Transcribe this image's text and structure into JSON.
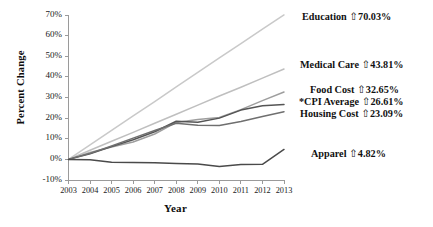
{
  "chart_data": {
    "type": "line",
    "title": "",
    "xlabel": "Year",
    "ylabel": "Percent Change",
    "x": [
      2003,
      2004,
      2005,
      2006,
      2007,
      2008,
      2009,
      2010,
      2011,
      2012,
      2013
    ],
    "categories": [
      "2003",
      "2004",
      "2005",
      "2006",
      "2007",
      "2008",
      "2009",
      "2010",
      "2011",
      "2012",
      "2013"
    ],
    "xlim": [
      2003,
      2013
    ],
    "ylim": [
      -10,
      70
    ],
    "ytick_labels": [
      "70%",
      "60%",
      "50%",
      "40%",
      "30%",
      "20%",
      "10%",
      "0%",
      "-10%"
    ],
    "ytick_values": [
      70,
      60,
      50,
      40,
      30,
      20,
      10,
      0,
      -10
    ],
    "grid": false,
    "legend_position": "right-inline-labels",
    "footnote_marker": "*",
    "series": [
      {
        "name": "Education",
        "label": "Education",
        "arrow": "⇧",
        "end_value_text": "70.03%",
        "end_value": 70.03,
        "color": "#c9c9c9",
        "values": [
          0,
          7.0,
          14.1,
          21.1,
          28.0,
          35.2,
          42.2,
          49.2,
          56.1,
          63.1,
          70.03
        ]
      },
      {
        "name": "Medical Care",
        "label": "Medical Care",
        "arrow": "⇧",
        "end_value_text": "43.81%",
        "end_value": 43.81,
        "color": "#bfbfbf",
        "values": [
          0,
          4.4,
          8.8,
          13.1,
          17.5,
          21.9,
          26.3,
          30.7,
          35.0,
          39.4,
          43.81
        ]
      },
      {
        "name": "Food Cost",
        "label": "Food Cost",
        "arrow": "⇧",
        "end_value_text": "32.65%",
        "end_value": 32.65,
        "color": "#9e9e9e",
        "values": [
          0,
          3.4,
          6.0,
          8.4,
          12.3,
          17.9,
          19.3,
          20.3,
          24.1,
          28.5,
          32.65
        ]
      },
      {
        "name": "*CPI Average",
        "label": "*CPI Average",
        "arrow": "⇧",
        "end_value_text": "26.61%",
        "end_value": 26.61,
        "color": "#555555",
        "values": [
          0,
          2.7,
          6.2,
          9.5,
          13.4,
          18.5,
          18.0,
          20.0,
          23.9,
          26.0,
          26.61
        ]
      },
      {
        "name": "Housing Cost",
        "label": "Housing Cost",
        "arrow": "⇧",
        "end_value_text": "23.09%",
        "end_value": 23.09,
        "color": "#6f6f6f",
        "values": [
          0,
          2.9,
          6.5,
          10.3,
          14.0,
          17.5,
          16.6,
          16.4,
          18.4,
          20.8,
          23.09
        ]
      },
      {
        "name": "Apparel",
        "label": "Apparel",
        "arrow": "⇧",
        "end_value_text": "4.82%",
        "end_value": 4.82,
        "color": "#4a4a4a",
        "values": [
          0,
          -0.2,
          -1.4,
          -1.5,
          -1.6,
          -2.0,
          -2.2,
          -3.4,
          -2.5,
          -2.4,
          4.82
        ]
      }
    ],
    "labels": [
      {
        "text": "Education",
        "arrow": "⇧",
        "value": "70.03%",
        "left": 302,
        "top": 11
      },
      {
        "text": "Medical Care",
        "arrow": "⇧",
        "value": "43.81%",
        "left": 300,
        "top": 59
      },
      {
        "text": "Food Cost",
        "arrow": "⇧",
        "value": "32.65%",
        "left": 310,
        "top": 84
      },
      {
        "text": "*CPI Average",
        "arrow": "⇧",
        "value": "26.61%",
        "left": 299,
        "top": 96
      },
      {
        "text": "Housing Cost",
        "arrow": "⇧",
        "value": "23.09%",
        "left": 300,
        "top": 108
      },
      {
        "text": "Apparel",
        "arrow": "⇧",
        "value": "4.82%",
        "left": 311,
        "top": 148
      }
    ]
  }
}
